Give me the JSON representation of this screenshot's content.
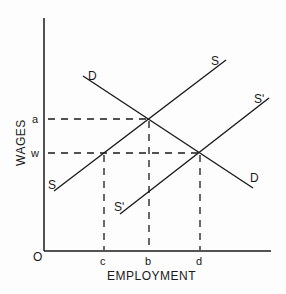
{
  "diagram": {
    "type": "labor-market-supply-demand",
    "axes": {
      "y_label": "WAGES",
      "x_label": "EMPLOYMENT",
      "origin_label": "O"
    },
    "y_ticks": [
      {
        "label": "a"
      },
      {
        "label": "w"
      }
    ],
    "x_ticks": [
      {
        "label": "c"
      },
      {
        "label": "b"
      },
      {
        "label": "d"
      }
    ],
    "curves": {
      "demand": {
        "label_start": "D",
        "label_end": "D"
      },
      "supply": {
        "label_start": "S",
        "label_end": "S"
      },
      "supply_shifted": {
        "label_start": "Sʹ",
        "label_end": "Sʹ"
      }
    },
    "colors": {
      "ink": "#1a1a1a",
      "background": "#fdfdfd"
    }
  }
}
